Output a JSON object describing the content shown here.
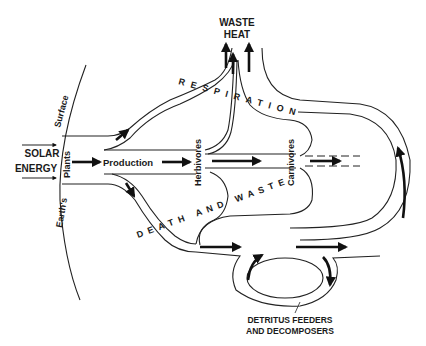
{
  "diagram": {
    "labels": {
      "waste_heat_line1": "WASTE",
      "waste_heat_line2": "HEAT",
      "respiration": "RESPIRATION",
      "solar_line1": "SOLAR",
      "solar_line2": "ENERGY",
      "surface": "Surface",
      "earths": "Earth's",
      "plants": "Plants",
      "production": "Production",
      "herbivores": "Herbivores",
      "carnivores": "Carnivores",
      "death_and_waste": "DEATH AND WASTE",
      "detritus_line1": "DETRITUS FEEDERS",
      "detritus_line2": "AND DECOMPOSERS"
    },
    "nodes": [
      "Plants",
      "Herbivores",
      "Carnivores",
      "Detritus Feeders and Decomposers"
    ],
    "flows": [
      {
        "from": "Solar Energy",
        "to": "Plants"
      },
      {
        "from": "Plants",
        "to": "Herbivores",
        "label": "Production"
      },
      {
        "from": "Herbivores",
        "to": "Carnivores"
      },
      {
        "from": "Plants/Herbivores/Carnivores",
        "to": "Waste Heat",
        "label": "Respiration"
      },
      {
        "from": "Plants/Herbivores/Carnivores",
        "to": "Detritus Feeders and Decomposers",
        "label": "Death and Waste"
      }
    ],
    "colors": {
      "ink": "#1a1a1a",
      "background": "#ffffff"
    }
  }
}
